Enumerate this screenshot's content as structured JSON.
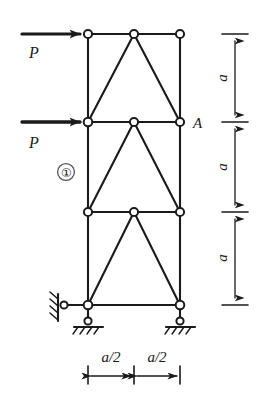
{
  "figure": {
    "kind": "structural-truss-diagram",
    "colors": {
      "line": "#1a1a1a",
      "background": "#ffffff",
      "joint_fill": "#ffffff"
    }
  },
  "loads": [
    {
      "id": "load-top",
      "label": "P",
      "direction": "right",
      "applied_at": "top-left joint"
    },
    {
      "id": "load-middle",
      "label": "P",
      "direction": "right",
      "applied_at": "second-level left joint"
    }
  ],
  "labels": {
    "joint_A": "A",
    "member_1": "①"
  },
  "dimensions": {
    "vertical": [
      {
        "id": "dim-a-top",
        "label": "a"
      },
      {
        "id": "dim-a-middle",
        "label": "a"
      },
      {
        "id": "dim-a-bottom",
        "label": "a"
      }
    ],
    "horizontal": [
      {
        "id": "dim-a-half-left",
        "label": "a/2"
      },
      {
        "id": "dim-a-half-right",
        "label": "a/2"
      }
    ]
  },
  "supports": [
    {
      "id": "support-left-link",
      "type": "horizontal-link-roller",
      "note": "hatched wall at left, horizontal link to base joint"
    },
    {
      "id": "support-left-base",
      "type": "vertical-link-pin",
      "note": "short vertical link to hatched ground"
    },
    {
      "id": "support-right-base",
      "type": "vertical-link-pin",
      "note": "short vertical link to hatched ground"
    }
  ],
  "geometry": {
    "columns_x": [
      88,
      180
    ],
    "mid_x": 134,
    "chords_y": [
      34,
      122,
      212,
      305
    ],
    "panels": [
      {
        "id": "panel-top",
        "diagonals": [
          "bottom-left-to-top-mid",
          "top-mid-to-bottom-right"
        ]
      },
      {
        "id": "panel-middle",
        "diagonals": [
          "bottom-left-to-top-mid",
          "top-mid-to-bottom-right"
        ]
      },
      {
        "id": "panel-bottom",
        "diagonals": [
          "bottom-left-to-top-mid",
          "top-mid-to-bottom-right"
        ]
      }
    ]
  }
}
